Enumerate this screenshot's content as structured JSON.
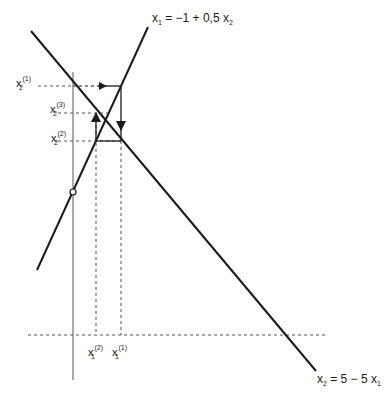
{
  "diagram": {
    "type": "fixed-point iteration (Gauss-Seidel) on two linear equations",
    "equations": {
      "rising_line": {
        "lhs": "x",
        "lhs_sub": "1",
        "rhs": "= −1 + 0,5 x",
        "rhs_sub": "2"
      },
      "falling_line": {
        "lhs": "x",
        "lhs_sub": "2",
        "rhs": "= 5 − 5 x",
        "rhs_sub": "1"
      }
    },
    "y_labels": [
      {
        "base": "x",
        "sub": "2",
        "sup": "(1)"
      },
      {
        "base": "x",
        "sub": "2",
        "sup": "(3)"
      },
      {
        "base": "x",
        "sub": "2",
        "sup": "(2)"
      }
    ],
    "x_labels": [
      {
        "base": "x",
        "sub": "1",
        "sup": "(2)"
      },
      {
        "base": "x",
        "sub": "1",
        "sup": "(1)"
      }
    ],
    "colors": {
      "line": "#1a1a1a",
      "axis": "#555555",
      "dashed": "#555555"
    }
  }
}
